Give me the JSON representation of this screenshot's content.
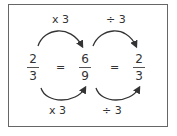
{
  "diagram": {
    "operations": {
      "top_left": "x 3",
      "top_right": "÷ 3",
      "bottom_left": "x 3",
      "bottom_right": "÷ 3"
    },
    "fractions": [
      {
        "numerator": "2",
        "denominator": "3"
      },
      {
        "numerator": "6",
        "denominator": "9"
      },
      {
        "numerator": "2",
        "denominator": "3"
      }
    ],
    "equals": [
      "=",
      "="
    ]
  }
}
